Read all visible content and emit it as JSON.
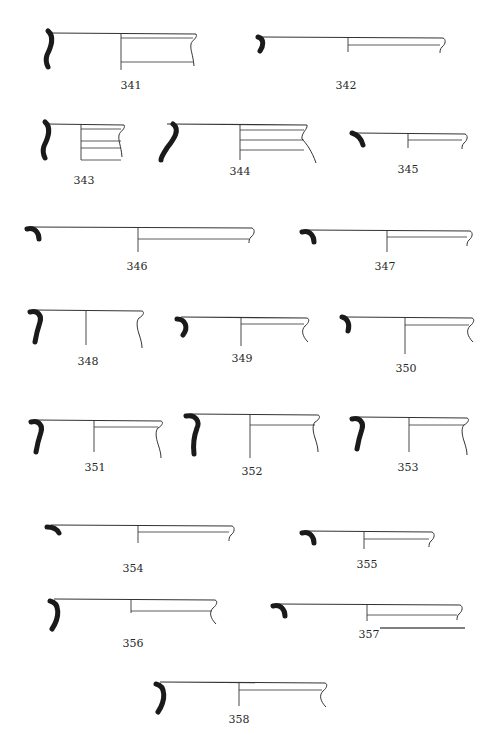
{
  "plate": {
    "title": "Pottery rim profiles",
    "ink_color": "#1a1a1a",
    "line_color": "#333333",
    "background": "#ffffff"
  },
  "figures": [
    {
      "id": "341",
      "label": "341",
      "lx": 131,
      "ly": 88,
      "rim_y": 33,
      "x0": 46,
      "x1": 196,
      "axis_x": 121,
      "axis_bottom": 70,
      "bands": [
        38,
        62
      ],
      "wall": "ogee",
      "profile": "S-deep"
    },
    {
      "id": "342",
      "label": "342",
      "lx": 346,
      "ly": 88,
      "rim_y": 37,
      "x0": 258,
      "x1": 443,
      "axis_x": 348,
      "axis_bottom": 52,
      "bands": [
        45
      ],
      "wall": "short",
      "profile": "knob"
    },
    {
      "id": "343",
      "label": "343",
      "lx": 84,
      "ly": 183,
      "rim_y": 124,
      "x0": 43,
      "x1": 124,
      "axis_x": 81,
      "axis_bottom": 160,
      "bands": [
        129,
        141,
        148,
        160
      ],
      "wall": "ogee",
      "profile": "S-deep"
    },
    {
      "id": "344",
      "label": "344",
      "lx": 240,
      "ly": 174,
      "rim_y": 124,
      "x0": 163,
      "x1": 307,
      "axis_x": 240,
      "axis_bottom": 160,
      "bands": [
        130,
        140,
        150
      ],
      "wall": "flare",
      "profile": "S-long"
    },
    {
      "id": "345",
      "label": "345",
      "lx": 408,
      "ly": 172,
      "rim_y": 133,
      "x0": 352,
      "x1": 465,
      "axis_x": 408,
      "axis_bottom": 148,
      "bands": [
        140
      ],
      "wall": "short",
      "profile": "hook"
    },
    {
      "id": "346",
      "label": "346",
      "lx": 137,
      "ly": 269,
      "rim_y": 227,
      "x0": 27,
      "x1": 252,
      "axis_x": 138,
      "axis_bottom": 252,
      "bands": [
        239
      ],
      "wall": "short",
      "profile": "thick-hook"
    },
    {
      "id": "347",
      "label": "347",
      "lx": 385,
      "ly": 269,
      "rim_y": 230,
      "x0": 302,
      "x1": 470,
      "axis_x": 387,
      "axis_bottom": 252,
      "bands": [
        237
      ],
      "wall": "short",
      "profile": "thick-hook"
    },
    {
      "id": "348",
      "label": "348",
      "lx": 88,
      "ly": 364,
      "rim_y": 310,
      "x0": 30,
      "x1": 142,
      "axis_x": 86,
      "axis_bottom": 345,
      "bands": [],
      "wall": "long",
      "profile": "seven"
    },
    {
      "id": "349",
      "label": "349",
      "lx": 242,
      "ly": 361,
      "rim_y": 317,
      "x0": 177,
      "x1": 307,
      "axis_x": 241,
      "axis_bottom": 346,
      "bands": [
        324
      ],
      "wall": "mid",
      "profile": "crescent"
    },
    {
      "id": "350",
      "label": "350",
      "lx": 406,
      "ly": 371,
      "rim_y": 317,
      "x0": 342,
      "x1": 472,
      "axis_x": 405,
      "axis_bottom": 354,
      "bands": [
        325
      ],
      "wall": "mid",
      "profile": "crescent-small"
    },
    {
      "id": "351",
      "label": "351",
      "lx": 95,
      "ly": 470,
      "rim_y": 420,
      "x0": 31,
      "x1": 161,
      "axis_x": 94,
      "axis_bottom": 452,
      "bands": [
        427
      ],
      "wall": "long",
      "profile": "seven"
    },
    {
      "id": "352",
      "label": "352",
      "lx": 252,
      "ly": 474,
      "rim_y": 414,
      "x0": 186,
      "x1": 318,
      "axis_x": 250,
      "axis_bottom": 458,
      "bands": [
        425
      ],
      "wall": "long",
      "profile": "seven-tall"
    },
    {
      "id": "353",
      "label": "353",
      "lx": 408,
      "ly": 470,
      "rim_y": 417,
      "x0": 352,
      "x1": 467,
      "axis_x": 409,
      "axis_bottom": 452,
      "bands": [
        425
      ],
      "wall": "long",
      "profile": "seven"
    },
    {
      "id": "354",
      "label": "354",
      "lx": 133,
      "ly": 571,
      "rim_y": 525,
      "x0": 47,
      "x1": 232,
      "axis_x": 138,
      "axis_bottom": 543,
      "bands": [
        532
      ],
      "wall": "short",
      "profile": "flat-hook"
    },
    {
      "id": "355",
      "label": "355",
      "lx": 367,
      "ly": 567,
      "rim_y": 531,
      "x0": 302,
      "x1": 432,
      "axis_x": 364,
      "axis_bottom": 549,
      "bands": [
        539
      ],
      "wall": "short",
      "profile": "thick-hook"
    },
    {
      "id": "356",
      "label": "356",
      "lx": 133,
      "ly": 646,
      "rim_y": 599,
      "x0": 50,
      "x1": 215,
      "axis_x": 131,
      "axis_bottom": 613,
      "bands": [
        611
      ],
      "wall": "mid",
      "profile": "crescent-tall"
    },
    {
      "id": "357",
      "label": "357",
      "lx": 369,
      "ly": 637,
      "rim_y": 604,
      "x0": 273,
      "x1": 460,
      "axis_x": 367,
      "axis_bottom": 621,
      "bands": [
        615
      ],
      "wall": "short",
      "profile": "thick-hook"
    },
    {
      "id": "358",
      "label": "358",
      "lx": 239,
      "ly": 722,
      "rim_y": 682,
      "x0": 156,
      "x1": 325,
      "axis_x": 239,
      "axis_bottom": 706,
      "bands": [
        690
      ],
      "wall": "mid",
      "profile": "crescent-tall"
    }
  ],
  "scale_bar": {
    "x1": 380,
    "x2": 465,
    "y": 628
  }
}
